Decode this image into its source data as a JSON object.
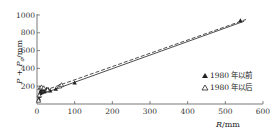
{
  "chart_data": {
    "type": "scatter",
    "title": "",
    "xlabel": "R/mm",
    "ylabel": "P+Pa/mm",
    "xlim": [
      0,
      600
    ],
    "ylim": [
      0,
      1000
    ],
    "xticks": [
      0,
      100,
      200,
      300,
      400,
      500,
      600
    ],
    "yticks": [
      200,
      400,
      600,
      800,
      1000
    ],
    "grid": false,
    "legend_position": "lower right",
    "series": [
      {
        "name": "1980 年以前",
        "marker": "filled-triangle",
        "points": [
          [
            5,
            60
          ],
          [
            6,
            90
          ],
          [
            8,
            120
          ],
          [
            10,
            150
          ],
          [
            12,
            130
          ],
          [
            15,
            160
          ],
          [
            20,
            140
          ],
          [
            25,
            170
          ],
          [
            30,
            165
          ],
          [
            35,
            150
          ],
          [
            50,
            170
          ],
          [
            100,
            240
          ],
          [
            540,
            940
          ]
        ]
      },
      {
        "name": "1980 年以后",
        "marker": "open-triangle",
        "points": [
          [
            4,
            40
          ],
          [
            6,
            100
          ],
          [
            8,
            180
          ],
          [
            12,
            190
          ],
          [
            18,
            180
          ],
          [
            28,
            160
          ],
          [
            60,
            200
          ],
          [
            65,
            215
          ]
        ]
      }
    ],
    "fit_lines": [
      {
        "style": "solid",
        "from": [
          5,
          100
        ],
        "to": [
          550,
          930
        ]
      },
      {
        "style": "dashed",
        "from": [
          5,
          130
        ],
        "to": [
          555,
          950
        ]
      }
    ]
  },
  "legend": {
    "items": [
      {
        "label": "1980 年以前",
        "marker": "▲"
      },
      {
        "label": "1980 年以后",
        "marker": "△"
      }
    ]
  },
  "axes": {
    "x_label_main": "R",
    "x_label_unit": "/mm",
    "y_label": "P + P",
    "y_label_sub": "a",
    "y_label_unit": "/mm",
    "x_ticks": [
      "0",
      "100",
      "200",
      "300",
      "400",
      "500",
      "600"
    ],
    "y_ticks": [
      "200",
      "400",
      "600",
      "800",
      "1000"
    ]
  }
}
